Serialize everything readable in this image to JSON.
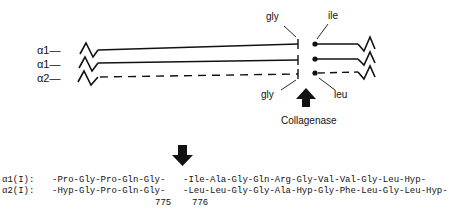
{
  "diagram": {
    "chains": [
      {
        "label": "α1—",
        "style": "solid"
      },
      {
        "label": "α1—",
        "style": "solid"
      },
      {
        "label": "α2—",
        "style": "dashed"
      }
    ],
    "cleavage_labels": {
      "top_left": "gly",
      "top_right": "ile",
      "bottom_left": "gly",
      "bottom_right": "leu"
    },
    "enzyme": "Collagenase"
  },
  "sequences": {
    "rows": [
      {
        "label": "α1(I):",
        "left": "-Pro-Gly-Pro-Gln-Gly-",
        "right": "-Ile-Ala-Gly-Gln-Arg-Gly-Val-Val-Gly-Leu-Hyp-"
      },
      {
        "label": "α2(I):",
        "left": "-Hyp-Gly-Pro-Gln-Gly-",
        "right": "-Leu-Leu-Gly-Gly-Ala-Hyp-Gly-Phe-Leu-Gly-Leu-Hyp-"
      }
    ],
    "positions": {
      "left": "775",
      "right": "776"
    }
  }
}
